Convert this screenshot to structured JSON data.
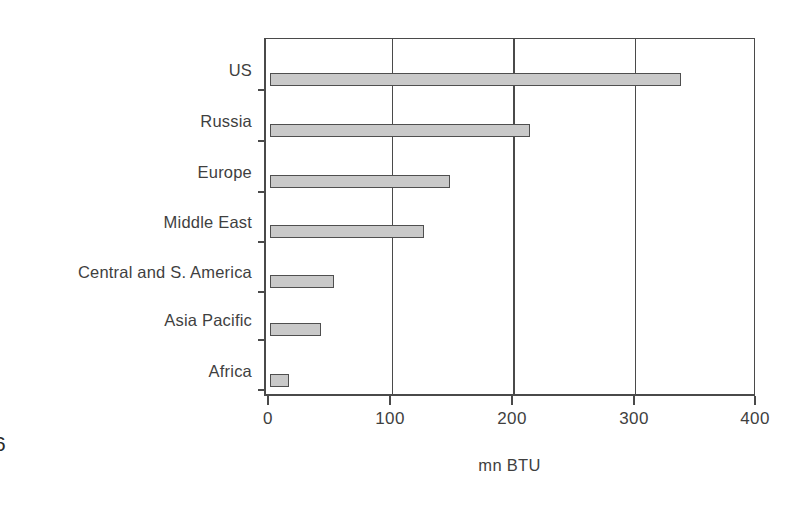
{
  "page_marker": "6",
  "chart_data": {
    "type": "bar",
    "orientation": "horizontal",
    "title": "",
    "subtitle": "",
    "categories": [
      "US",
      "Russia",
      "Europe",
      "Middle East",
      "Central and S. America",
      "Asia Pacific",
      "Africa"
    ],
    "values": [
      338,
      214,
      148,
      127,
      53,
      42,
      16
    ],
    "series": [
      {
        "name": "Energy consumption per capita",
        "values": [
          338,
          214,
          148,
          127,
          53,
          42,
          16
        ]
      }
    ],
    "xlabel": "mn BTU",
    "ylabel": "",
    "xlim": [
      0,
      400
    ],
    "xticks": [
      0,
      100,
      200,
      300,
      400
    ],
    "xtick_labels": [
      "0",
      "100",
      "200",
      "300",
      "400"
    ],
    "grid": {
      "vertical": true,
      "horizontal": false,
      "gridline_values": [
        100,
        200,
        300
      ]
    },
    "legend": {
      "visible": false,
      "position": "none",
      "entries": []
    },
    "colors": {
      "bar_fill": "#c9c9c9",
      "bar_border": "#4f4f4f",
      "axis": "#4a4a4a",
      "text": "#3f3f3f",
      "background": "#ffffff"
    }
  }
}
